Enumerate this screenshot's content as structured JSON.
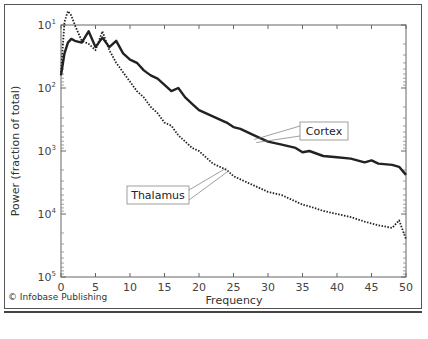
{
  "credit": "© Infobase Publishing",
  "chart_data": {
    "type": "line",
    "title": "",
    "xlabel": "Frequency",
    "ylabel": "Power (fraction of total)",
    "xlim": [
      0,
      50
    ],
    "ylim_exponents": [
      1,
      5
    ],
    "yscale": "log",
    "x_ticks": [
      0,
      5,
      10,
      15,
      20,
      25,
      30,
      35,
      40,
      45,
      50
    ],
    "y_ticks": [
      {
        "base": "10",
        "exp": "1"
      },
      {
        "base": "10",
        "exp": "2"
      },
      {
        "base": "10",
        "exp": "3"
      },
      {
        "base": "10",
        "exp": "4"
      },
      {
        "base": "10",
        "exp": "5"
      }
    ],
    "grid": false,
    "series": [
      {
        "name": "Cortex",
        "style": "solid-thick",
        "color": "#222222",
        "x": [
          0,
          0.5,
          1,
          1.5,
          2,
          3,
          4,
          5,
          6,
          7,
          8,
          9,
          10,
          11,
          12,
          13,
          14,
          15,
          16,
          17,
          18,
          19,
          20,
          22,
          24,
          25,
          26,
          28,
          30,
          32,
          34,
          35,
          36,
          38,
          40,
          42,
          44,
          45,
          46,
          48,
          49,
          50
        ],
        "exponent": [
          1.8,
          1.45,
          1.28,
          1.22,
          1.25,
          1.28,
          1.1,
          1.35,
          1.2,
          1.35,
          1.25,
          1.45,
          1.55,
          1.6,
          1.72,
          1.8,
          1.85,
          1.95,
          2.05,
          2.0,
          2.15,
          2.25,
          2.35,
          2.45,
          2.55,
          2.62,
          2.65,
          2.75,
          2.85,
          2.9,
          2.95,
          3.02,
          3.0,
          3.08,
          3.1,
          3.12,
          3.18,
          3.15,
          3.2,
          3.22,
          3.25,
          3.38
        ]
      },
      {
        "name": "Thalamus",
        "style": "dotted",
        "color": "#222222",
        "x": [
          0,
          0.5,
          1,
          1.5,
          2,
          3,
          4,
          5,
          6,
          7,
          8,
          9,
          10,
          11,
          12,
          13,
          14,
          15,
          16,
          17,
          18,
          19,
          20,
          22,
          24,
          25,
          26,
          28,
          30,
          32,
          34,
          35,
          36,
          38,
          40,
          42,
          44,
          45,
          46,
          48,
          49,
          50
        ],
        "exponent": [
          1.75,
          0.95,
          0.78,
          0.85,
          1.0,
          1.25,
          1.3,
          1.4,
          1.1,
          1.4,
          1.6,
          1.75,
          1.9,
          2.05,
          2.15,
          2.3,
          2.4,
          2.55,
          2.6,
          2.75,
          2.85,
          2.95,
          3.0,
          3.2,
          3.3,
          3.4,
          3.45,
          3.55,
          3.65,
          3.7,
          3.8,
          3.85,
          3.88,
          3.95,
          4.0,
          4.05,
          4.12,
          4.15,
          4.18,
          4.22,
          4.1,
          4.4
        ]
      }
    ],
    "annotations": [
      {
        "text": "Cortex",
        "target_x": 28,
        "target_exponent": 2.85
      },
      {
        "text": "Thalamus",
        "target_x": 24,
        "target_exponent": 3.3
      }
    ]
  }
}
